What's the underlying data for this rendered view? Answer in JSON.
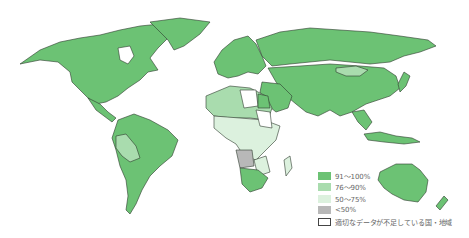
{
  "map": {
    "type": "choropleth-world",
    "legend": {
      "items": [
        {
          "label": "91～100%",
          "color": "#6cc274",
          "class": "c1"
        },
        {
          "label": "76～90%",
          "color": "#a9dcae",
          "class": "c2"
        },
        {
          "label": "50～75%",
          "color": "#dcf1de",
          "class": "c3"
        },
        {
          "label": "<50%",
          "color": "#b8b8b8",
          "class": "c4"
        },
        {
          "label": "適切なデータが不足している国・地域",
          "color": "#ffffff",
          "class": "c5"
        }
      ]
    }
  }
}
